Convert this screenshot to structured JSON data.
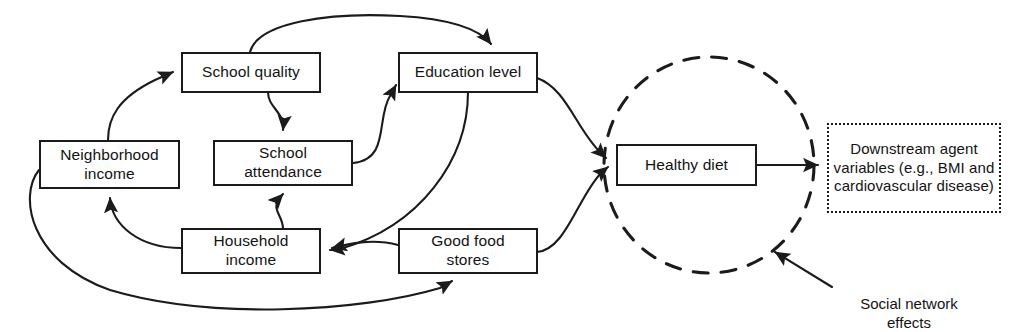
{
  "figure": {
    "kind": "causal-diagram",
    "stroke_color": "#1b1b1b",
    "text_color": "#131313",
    "background": "#ffffff"
  },
  "nodes": {
    "school_quality": {
      "label": "School quality"
    },
    "education_level": {
      "label": "Education level"
    },
    "neighborhood_income": {
      "label": "Neighborhood\nincome"
    },
    "school_attendance": {
      "label": "School\nattendance"
    },
    "household_income": {
      "label": "Household\nincome"
    },
    "good_food_stores": {
      "label": "Good food\nstores"
    },
    "healthy_diet": {
      "label": "Healthy diet"
    },
    "downstream": {
      "label": "Downstream agent variables (e.g., BMI and cardiovascular disease)"
    }
  },
  "annotations": {
    "social_network_effects": {
      "label": "Social network\neffects"
    }
  },
  "edges": [
    {
      "from": "neighborhood_income",
      "to": "school_quality"
    },
    {
      "from": "school_quality",
      "to": "education_level"
    },
    {
      "from": "school_quality",
      "to": "school_attendance"
    },
    {
      "from": "school_attendance",
      "to": "education_level"
    },
    {
      "from": "household_income",
      "to": "school_attendance"
    },
    {
      "from": "household_income",
      "to": "neighborhood_income"
    },
    {
      "from": "education_level",
      "to": "household_income"
    },
    {
      "from": "education_level",
      "to": "healthy_diet"
    },
    {
      "from": "good_food_stores",
      "to": "household_income"
    },
    {
      "from": "good_food_stores",
      "to": "healthy_diet"
    },
    {
      "from": "neighborhood_income",
      "to": "good_food_stores"
    },
    {
      "from": "healthy_diet",
      "to": "downstream"
    },
    {
      "from": "social_network_effects",
      "to": "social_network_circle"
    }
  ],
  "background_bleed": {
    "lines": [
      "the sample of nearest neighbors and the",
      "the prevalence of the outcome and the",
      "the social network effects of the agents",
      "variables that are rendered in the model."
    ]
  }
}
